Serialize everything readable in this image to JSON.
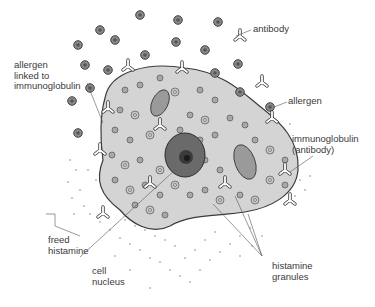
{
  "diagram": {
    "labels": {
      "antibody": "antibody",
      "allergen_linked": "allergen\nlinked to\nimmunoglobulin",
      "allergen": "allergen",
      "immunoglobulin": "immunoglobulin\n(antibody)",
      "freed_histamine": "freed\nhistamine",
      "cell_nucleus": "cell\nnucleus",
      "histamine_granules": "histamine\ngranules"
    },
    "colors": {
      "cell_fill": "#d4d4d4",
      "outline": "#3a3a3a",
      "nucleus": "#6a6a6a",
      "text": "#3a3a3a"
    }
  }
}
